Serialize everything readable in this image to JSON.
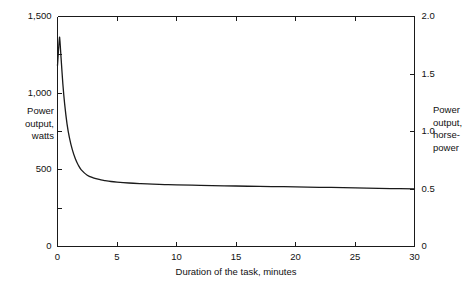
{
  "chart_data": {
    "type": "line",
    "title": "",
    "xlabel": "Duration of the task, minutes",
    "ylabel": "Power\noutput,\nwatts",
    "ylabel_right": "Power\noutput,\nhorse-\npower",
    "xlim": [
      0,
      30
    ],
    "ylim": [
      0,
      1500
    ],
    "ylim_right": [
      0,
      2.0
    ],
    "grid": false,
    "legend": null,
    "xticks": [
      0,
      5,
      10,
      15,
      20,
      25,
      30
    ],
    "xticklabels": [
      "0",
      "5",
      "10",
      "15",
      "20",
      "25",
      "30"
    ],
    "yticks": [
      0,
      500,
      1000,
      1500
    ],
    "yticklabels": [
      "0",
      "500",
      "1,000",
      "1,500"
    ],
    "yminorticks": [
      250,
      750,
      1250
    ],
    "yticks_right": [
      0,
      0.5,
      1.0,
      1.5,
      2.0
    ],
    "yticklabels_right": [
      "0",
      "0.5",
      "1.0",
      "1.5",
      "2.0"
    ],
    "series": [
      {
        "name": "Maximal sustainable power output",
        "units": "watts",
        "x": [
          0.0,
          0.15,
          0.2,
          0.3,
          0.45,
          0.6,
          0.8,
          1.0,
          1.25,
          1.5,
          1.75,
          2.0,
          2.5,
          3.0,
          3.5,
          4.0,
          4.5,
          5.0,
          6.0,
          7.0,
          8.0,
          9.0,
          10.0,
          12.0,
          14.0,
          16.0,
          18.0,
          20.0,
          22.0,
          24.0,
          26.0,
          28.0,
          30.0
        ],
        "y": [
          1180,
          1350,
          1345,
          1230,
          1060,
          930,
          800,
          710,
          630,
          572,
          530,
          500,
          465,
          448,
          437,
          430,
          424,
          420,
          414,
          410,
          407,
          404,
          402,
          399,
          396,
          393,
          391,
          389,
          386,
          384,
          381,
          378,
          376
        ]
      }
    ]
  },
  "axis_color": "#1a1a1a",
  "line_color": "#1a1a1a"
}
